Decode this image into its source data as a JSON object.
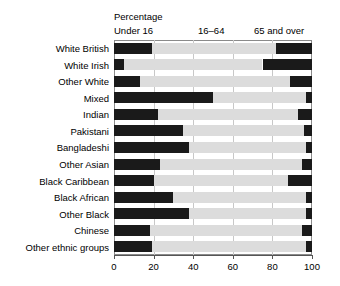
{
  "chart_data": {
    "type": "bar",
    "orientation": "horizontal",
    "stacked": true,
    "title": "",
    "subtitle": "",
    "xlabel": "",
    "ylabel": "",
    "unit_caption": "Percentage",
    "xlim": [
      0,
      100
    ],
    "xticks": [
      0,
      20,
      40,
      60,
      80,
      100
    ],
    "grid": true,
    "grid_axis": "x",
    "legend_position": "top-inline",
    "categories": [
      "White British",
      "White Irish",
      "Other White",
      "Mixed",
      "Indian",
      "Pakistani",
      "Bangladeshi",
      "Other Asian",
      "Black Caribbean",
      "Black African",
      "Other Black",
      "Chinese",
      "Other ethnic groups"
    ],
    "series": [
      {
        "name": "Under 16",
        "color": "#1a1a1a",
        "values": [
          19,
          5,
          13,
          50,
          22,
          35,
          38,
          23,
          20,
          30,
          38,
          18,
          19
        ]
      },
      {
        "name": "16–64",
        "color": "#dcdcdc",
        "values": [
          63,
          70,
          76,
          47,
          71,
          61,
          59,
          72,
          68,
          67,
          59,
          77,
          78
        ]
      },
      {
        "name": "65 and over",
        "color": "#1a1a1a",
        "values": [
          18,
          25,
          11,
          3,
          7,
          4,
          3,
          5,
          12,
          3,
          3,
          5,
          3
        ]
      }
    ],
    "cumulative_boundaries": [
      [
        19,
        82
      ],
      [
        5,
        75
      ],
      [
        13,
        89
      ],
      [
        50,
        97
      ],
      [
        22,
        93
      ],
      [
        35,
        96
      ],
      [
        38,
        97
      ],
      [
        23,
        95
      ],
      [
        20,
        88
      ],
      [
        30,
        97
      ],
      [
        38,
        97
      ],
      [
        18,
        95
      ],
      [
        19,
        97
      ]
    ]
  },
  "captions": {
    "percentage": "Percentage",
    "under16": "Under 16",
    "mid": "16–64",
    "over65": "65 and over"
  },
  "axis": {
    "tick_labels": [
      "0",
      "20",
      "40",
      "60",
      "80",
      "100"
    ]
  },
  "colors": {
    "dark_segment": "#1a1a1a",
    "light_segment": "#dcdcdc",
    "frame": "#8a8a8a",
    "gridline": "#c8c8c8",
    "text": "#000000"
  }
}
